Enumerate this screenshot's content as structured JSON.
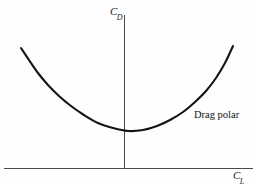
{
  "figure": {
    "background_color": "#fefefe",
    "width": 253,
    "height": 184,
    "axis_color": "#4a4a4a",
    "curve_color": "#141414"
  },
  "labels": {
    "y_axis_symbol": "C",
    "y_axis_subscript": "D",
    "x_axis_symbol": "C",
    "x_axis_subscript": "L",
    "curve_annotation": "Drag polar"
  },
  "chart_data": {
    "type": "line",
    "title": "",
    "subtitle": "",
    "xlabel": "C_L",
    "ylabel": "C_D",
    "grid": false,
    "legend": null,
    "annotations": [
      {
        "text": "Drag polar",
        "x_px": 194,
        "y_px": 110,
        "describes": "drag-polar-curve"
      }
    ],
    "axes": {
      "x_axis": {
        "label": "C_L",
        "tick_labels": [],
        "y_px": 168,
        "x_start_px": 4,
        "x_end_px": 253,
        "origin_x_px": 124,
        "description": "horizontal lift-coefficient axis, unlabeled ticks"
      },
      "y_axis": {
        "label": "C_D",
        "tick_labels": [],
        "x_px": 124,
        "y_start_px": 15,
        "y_end_px": 168,
        "description": "vertical drag-coefficient axis, unlabeled ticks"
      }
    },
    "series": [
      {
        "name": "Drag polar",
        "description": "Parabolic drag polar: C_D = C_D0 + k*C_L^2, drawn symmetric about the C_D axis with minimum drag at C_L near zero.",
        "equation": "C_D = C_D0 + k*C_L^2",
        "vertex_px": [
          128,
          131
        ],
        "points_px": [
          [
            21,
            48
          ],
          [
            29,
            60
          ],
          [
            38,
            73
          ],
          [
            48,
            85
          ],
          [
            59,
            96
          ],
          [
            71,
            106
          ],
          [
            84,
            115
          ],
          [
            98,
            123
          ],
          [
            113,
            128
          ],
          [
            128,
            131
          ],
          [
            143,
            130
          ],
          [
            157,
            126
          ],
          [
            170,
            120
          ],
          [
            183,
            112
          ],
          [
            195,
            102
          ],
          [
            206,
            91
          ],
          [
            216,
            78
          ],
          [
            225,
            63
          ],
          [
            233,
            46
          ]
        ]
      }
    ]
  }
}
